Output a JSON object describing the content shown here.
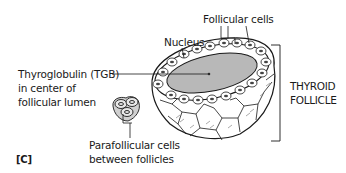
{
  "figure": {
    "panel_label": "[C]",
    "labels": {
      "follicular_cells": "Follicular cells",
      "nucleus": "Nucleus",
      "thyroglobulin_line1": "Thyroglobulin (TGB)",
      "thyroglobulin_line2": "in center of",
      "thyroglobulin_line3": "follicular lumen",
      "parafollicular_line1": "Parafollicular cells",
      "parafollicular_line2": "between follicles",
      "thyroid_follicle_line1": "THYROID",
      "thyroid_follicle_line2": "FOLLICLE"
    },
    "colors": {
      "lumen": "#b8b8b8",
      "ink": "#1a1a1a",
      "background": "#ffffff"
    }
  }
}
